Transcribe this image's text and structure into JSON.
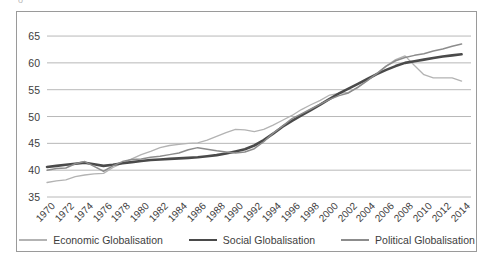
{
  "figure": {
    "top_clipped_glyph": "o",
    "background_color": "#ffffff",
    "frame_color": "#9a9a9a",
    "gridline_color": "#a6a6a6",
    "text_color": "#3d3d3d"
  },
  "legend": {
    "position": "bottom",
    "entries": [
      {
        "label": "Economic Globalisation",
        "color": "#b3b3b3",
        "width": 1.3,
        "swatch_name": "legend-swatch-economic"
      },
      {
        "label": "Social Globalisation",
        "color": "#4a4a4a",
        "width": 2.6,
        "swatch_name": "legend-swatch-social"
      },
      {
        "label": "Political Globalisation",
        "color": "#8c8c8c",
        "width": 1.5,
        "swatch_name": "legend-swatch-political"
      }
    ]
  },
  "chart_data": {
    "type": "line",
    "title": "",
    "subtitle": "",
    "xlabel": "",
    "ylabel": "",
    "grid": true,
    "legend_position": "bottom",
    "ylim": [
      35,
      66.5
    ],
    "yticks": [
      35,
      40,
      45,
      50,
      55,
      60,
      65
    ],
    "xlim": [
      1970,
      2015
    ],
    "xticks": [
      1970,
      1972,
      1974,
      1976,
      1978,
      1980,
      1982,
      1984,
      1986,
      1988,
      1990,
      1992,
      1994,
      1996,
      1998,
      2000,
      2002,
      2004,
      2006,
      2008,
      2010,
      2012,
      2014
    ],
    "x": [
      1970,
      1971,
      1972,
      1973,
      1974,
      1975,
      1976,
      1977,
      1978,
      1979,
      1980,
      1981,
      1982,
      1983,
      1984,
      1985,
      1986,
      1987,
      1988,
      1989,
      1990,
      1991,
      1992,
      1993,
      1994,
      1995,
      1996,
      1997,
      1998,
      1999,
      2000,
      2001,
      2002,
      2003,
      2004,
      2005,
      2006,
      2007,
      2008,
      2009,
      2010,
      2011,
      2012,
      2013,
      2014
    ],
    "series": [
      {
        "name": "Economic Globalisation",
        "color": "#b3b3b3",
        "width": 1.3,
        "values": [
          37.7,
          38.0,
          38.2,
          38.8,
          39.1,
          39.3,
          39.4,
          40.5,
          41.3,
          42.1,
          42.9,
          43.5,
          44.2,
          44.6,
          44.8,
          45.0,
          45.1,
          45.6,
          46.3,
          47.0,
          47.6,
          47.5,
          47.2,
          47.6,
          48.4,
          49.3,
          50.2,
          51.3,
          52.2,
          53.0,
          54.0,
          54.3,
          54.5,
          55.4,
          56.7,
          58.0,
          59.4,
          60.6,
          61.3,
          59.5,
          57.8,
          57.2,
          57.2,
          57.2,
          56.6
        ]
      },
      {
        "name": "Social Globalisation",
        "color": "#4a4a4a",
        "width": 2.6,
        "values": [
          40.6,
          40.8,
          41.0,
          41.2,
          41.4,
          41.1,
          40.8,
          41.0,
          41.3,
          41.5,
          41.7,
          41.9,
          42.0,
          42.1,
          42.2,
          42.3,
          42.4,
          42.6,
          42.8,
          43.1,
          43.5,
          43.9,
          44.6,
          45.6,
          46.8,
          48.1,
          49.2,
          50.2,
          51.2,
          52.2,
          53.3,
          54.3,
          55.2,
          56.1,
          57.0,
          57.9,
          58.7,
          59.4,
          60.0,
          60.3,
          60.6,
          60.9,
          61.2,
          61.4,
          61.6
        ]
      },
      {
        "name": "Political Globalisation",
        "color": "#8c8c8c",
        "width": 1.5,
        "values": [
          40.0,
          40.3,
          40.4,
          41.2,
          41.6,
          40.7,
          39.8,
          40.8,
          41.6,
          42.0,
          42.1,
          42.4,
          42.6,
          42.9,
          43.2,
          43.8,
          44.2,
          43.9,
          43.6,
          43.4,
          43.2,
          43.4,
          44.0,
          45.3,
          46.9,
          48.2,
          49.6,
          50.5,
          51.4,
          52.3,
          53.2,
          53.9,
          54.4,
          55.5,
          56.7,
          58.0,
          59.4,
          60.4,
          61.0,
          61.4,
          61.7,
          62.2,
          62.6,
          63.1,
          63.5
        ]
      }
    ]
  }
}
